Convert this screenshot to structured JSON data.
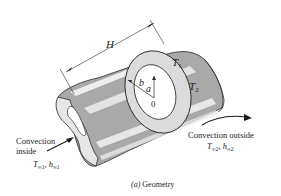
{
  "figure": {
    "caption": "(a) Geometry",
    "caption_prefix": "(a)",
    "caption_text": "Geometry",
    "dimension_label": "H",
    "inner_radius_label": "a",
    "outer_radius_label": "b",
    "center_label": "0",
    "surface_temp_1": "T",
    "surface_temp_1_sub": "1",
    "surface_temp_2": "T",
    "surface_temp_2_sub": "2",
    "inside": {
      "line1": "Convection",
      "line2": "inside",
      "temp": "T",
      "temp_sub": "∞1",
      "coef": "h",
      "coef_sub": "∞1"
    },
    "outside": {
      "line1": "Convection outside",
      "temp": "T",
      "temp_sub": "∞2",
      "coef": "h",
      "coef_sub": "∞2"
    },
    "colors": {
      "shell_gray": "#a9a9a9",
      "shell_light": "#e6e6e6",
      "ring_face": "#dcdcdc",
      "highlight": "#f5f5f5",
      "line": "#2a2a2a"
    }
  }
}
